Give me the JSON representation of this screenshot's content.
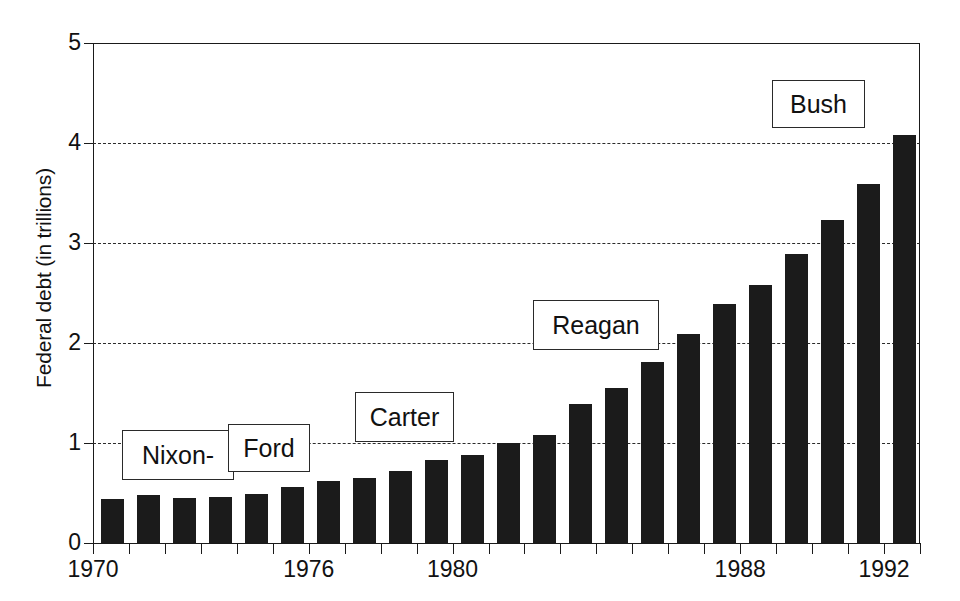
{
  "chart_data": {
    "type": "bar",
    "title": "",
    "xlabel": "",
    "ylabel": "Federal debt (in trillions)",
    "ylim": [
      0,
      5
    ],
    "yticks": [
      0,
      1,
      2,
      3,
      4,
      5
    ],
    "ytick_labels": [
      "0",
      "1",
      "2",
      "3",
      "4",
      "5"
    ],
    "xlim": [
      1969.5,
      1992.5
    ],
    "xtick_labels": [
      "1970",
      "1976",
      "1980",
      "1988",
      "1992"
    ],
    "xtick_years": [
      1970,
      1976,
      1980,
      1988,
      1992
    ],
    "grid": "horizontal-dashed",
    "legend": "none",
    "bar_color": "#1b1b1b",
    "categories": [
      "1970",
      "1971",
      "1972",
      "1973",
      "1974",
      "1975",
      "1976",
      "1977",
      "1978",
      "1979",
      "1980",
      "1981",
      "1982",
      "1983",
      "1984",
      "1985",
      "1986",
      "1987",
      "1988",
      "1989",
      "1990",
      "1991",
      "1992"
    ],
    "values": [
      0.44,
      0.48,
      0.45,
      0.46,
      0.49,
      0.56,
      0.62,
      0.65,
      0.72,
      0.83,
      0.88,
      1.0,
      1.08,
      1.39,
      1.55,
      1.81,
      2.09,
      2.39,
      2.58,
      2.89,
      3.23,
      3.59,
      4.08
    ],
    "annotations": [
      {
        "name": "nixon",
        "label": "Nixon-",
        "left": 122,
        "top": 430,
        "width": 110,
        "height": 48
      },
      {
        "name": "ford",
        "label": "Ford",
        "left": 228,
        "top": 424,
        "width": 80,
        "height": 46
      },
      {
        "name": "carter",
        "label": "Carter",
        "left": 355,
        "top": 392,
        "width": 97,
        "height": 48
      },
      {
        "name": "reagan",
        "label": "Reagan",
        "left": 533,
        "top": 300,
        "width": 124,
        "height": 48
      },
      {
        "name": "bush",
        "label": "Bush",
        "left": 772,
        "top": 80,
        "width": 91,
        "height": 46
      }
    ]
  }
}
